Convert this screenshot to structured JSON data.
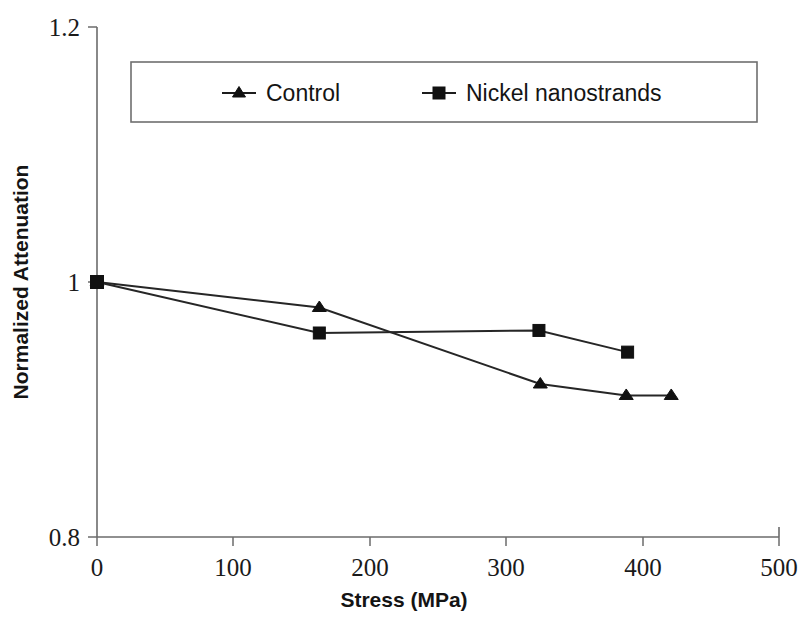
{
  "chart_data": {
    "type": "line",
    "title": "",
    "xlabel": "Stress (MPa)",
    "ylabel": "Normalized Attenuation",
    "xlim": [
      0,
      500
    ],
    "ylim": [
      0.8,
      1.2
    ],
    "xticks": [
      "0",
      "100",
      "200",
      "300",
      "400",
      "500"
    ],
    "xtick_values": [
      0,
      100,
      200,
      300,
      400,
      500
    ],
    "yticks": [
      "1.2",
      "1",
      "0.8"
    ],
    "ytick_values": [
      1.2,
      1,
      0.8
    ],
    "grid": false,
    "legend_position": "top-inside",
    "series": [
      {
        "name": "Control",
        "marker": "triangle",
        "color": "#111111",
        "x": [
          0,
          163,
          325,
          388,
          421
        ],
        "values": [
          1.0,
          0.98,
          0.92,
          0.911,
          0.911
        ]
      },
      {
        "name": "Nickel nanostrands",
        "marker": "square",
        "color": "#111111",
        "x": [
          0,
          163,
          324,
          389
        ],
        "values": [
          1.0,
          0.96,
          0.962,
          0.945
        ]
      }
    ]
  },
  "legend": {
    "entries": [
      {
        "label": "Control",
        "marker": "triangle-marker-icon"
      },
      {
        "label": "Nickel nanostrands",
        "marker": "square-marker-icon"
      }
    ]
  },
  "axes": {
    "y_title": "Normalized Attenuation",
    "x_title": "Stress (MPa)",
    "y_tick_top": "1.2",
    "y_tick_mid": "1",
    "y_tick_bottom": "0.8",
    "x_tick_0": "0",
    "x_tick_1": "100",
    "x_tick_2": "200",
    "x_tick_3": "300",
    "x_tick_4": "400",
    "x_tick_5": "500"
  },
  "colors": {
    "line": "#262626",
    "marker": "#111111",
    "axis": "#6b6b6b",
    "background": "#ffffff"
  }
}
